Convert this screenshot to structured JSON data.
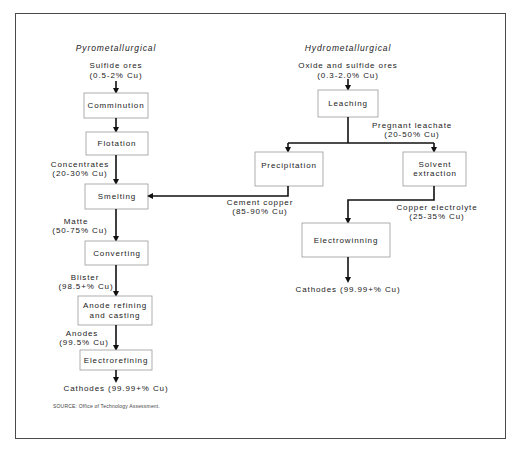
{
  "diagram": {
    "pyro": {
      "heading": "Pyrometallurgical",
      "input": {
        "line1": "Sulfide ores",
        "line2": "(0.5-2% Cu)"
      },
      "steps": [
        {
          "label": "Comminution"
        },
        {
          "label": "Flotation"
        },
        {
          "label": "Smelting"
        },
        {
          "label": "Converting"
        },
        {
          "label1": "Anode refining",
          "label2": "and casting"
        },
        {
          "label": "Electrorefining"
        }
      ],
      "flows": [
        {
          "line1": "Concentrates",
          "line2": "(20-30% Cu)"
        },
        {
          "line1": "Matte",
          "line2": "(50-75% Cu)"
        },
        {
          "line1": "Blister",
          "line2": "(98.5+% Cu)"
        },
        {
          "line1": "Anodes",
          "line2": "(99.5% Cu)"
        }
      ],
      "output": "Cathodes (99.99+% Cu)"
    },
    "hydro": {
      "heading": "Hydrometallurgical",
      "input": {
        "line1": "Oxide and sulfide ores",
        "line2": "(0.3-2.0% Cu)"
      },
      "steps": [
        {
          "label": "Leaching"
        },
        {
          "label": "Precipitation"
        },
        {
          "label1": "Solvent",
          "label2": "extraction"
        },
        {
          "label": "Electrowinning"
        }
      ],
      "flows": [
        {
          "line1": "Pregnant leachate",
          "line2": "(20-50% Cu)"
        },
        {
          "line1": "Cement copper",
          "line2": "(85-90% Cu)"
        },
        {
          "line1": "Copper electrolyte",
          "line2": "(25-35% Cu)"
        }
      ],
      "output": "Cathodes (99.99+% Cu)"
    },
    "source": "SOURCE: Office of Technology Assessment."
  }
}
